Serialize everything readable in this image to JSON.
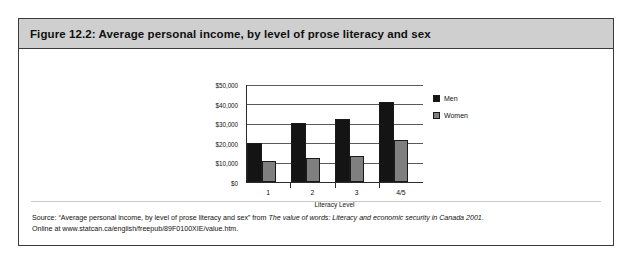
{
  "figure": {
    "title": "Figure 12.2: Average personal income, by level of prose literacy and sex",
    "source_prefix": "Source: “Average personal income, by level of prose literacy and sex” from ",
    "source_italic": "The value of words: Literacy and economic security in Canada 2001",
    "source_suffix": ".",
    "source_line2": "Online at www.statcan.ca/english/freepub/89F0100XIE/value.htm."
  },
  "colors": {
    "men": "#141414",
    "women": "#7f7f7f",
    "title_bar": "#cfcfcf",
    "frame": "#3a3a3a"
  },
  "chart_data": {
    "type": "bar",
    "title": "",
    "xlabel": "Literacy Level",
    "ylabel": "",
    "categories": [
      "1",
      "2",
      "3",
      "4/5"
    ],
    "series": [
      {
        "name": "Men",
        "values": [
          20000,
          30200,
          32500,
          41200
        ]
      },
      {
        "name": "Women",
        "values": [
          10900,
          12400,
          13300,
          21400
        ]
      }
    ],
    "ylim": [
      0,
      50000
    ],
    "yticks": [
      0,
      10000,
      20000,
      30000,
      40000,
      50000
    ],
    "ytick_labels": [
      "$0",
      "$10,000",
      "$20,000",
      "$30,000",
      "$40,000",
      "$50,000"
    ],
    "grid": true,
    "legend_position": "right"
  }
}
